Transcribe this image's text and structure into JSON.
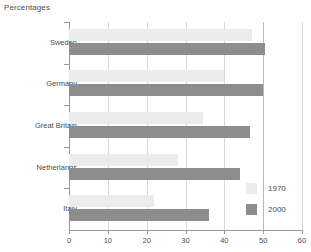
{
  "chart_data": {
    "type": "bar",
    "orientation": "horizontal",
    "title": "Percentages",
    "xlabel": "",
    "ylabel": "",
    "categories": [
      "Sweden",
      "Germany",
      "Great Britain",
      "Netherlands",
      "Italy"
    ],
    "series": [
      {
        "name": "1970",
        "color": "#ececec",
        "values": [
          47,
          40,
          34.5,
          28,
          22
        ]
      },
      {
        "name": "2000",
        "color": "#8d8d8d",
        "values": [
          50.5,
          50,
          46.5,
          44,
          36
        ]
      }
    ],
    "xlim": [
      0,
      60
    ],
    "xticks": [
      0,
      10,
      20,
      30,
      40,
      50,
      60
    ],
    "xtick_labels": [
      "0",
      "10",
      "20",
      "30",
      "40",
      "50",
      "60"
    ],
    "grid": true,
    "grid_axis": "x",
    "legend_position": "bottom-right",
    "legend_entries": [
      "1970",
      "2000"
    ]
  },
  "axis_colors": {
    "axis_line": "#9a9a9a",
    "gridline": "#d8d8d8",
    "gridline_major": "#b9b9b9",
    "text": "#4d4d4d",
    "background": "#ffffff"
  }
}
